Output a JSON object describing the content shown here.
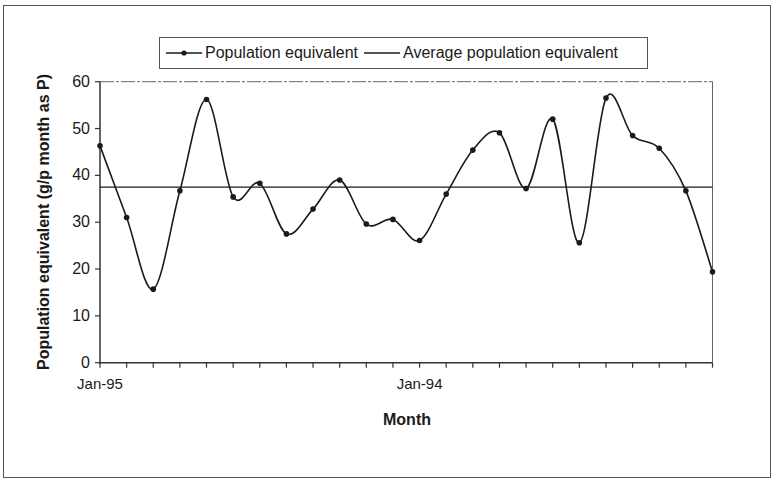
{
  "chart_data": {
    "type": "line",
    "title": "",
    "xlabel": "Month",
    "ylabel": "Population equivalent (g/p month as P)",
    "ylim": [
      0,
      60
    ],
    "yticks": [
      0,
      10,
      20,
      30,
      40,
      50,
      60
    ],
    "x_tick_labels": [
      {
        "index": 0,
        "label": "Jan-95"
      },
      {
        "index": 12,
        "label": "Jan-94"
      }
    ],
    "n_points": 24,
    "grid": false,
    "smoothed": true,
    "legend_position": "top",
    "series": [
      {
        "name": "Population equivalent",
        "marker": "circle",
        "values": [
          46.3,
          31.0,
          15.7,
          36.7,
          56.2,
          35.4,
          38.3,
          27.5,
          32.8,
          39.0,
          29.6,
          30.6,
          26.1,
          36.0,
          45.4,
          49.1,
          37.2,
          52.0,
          25.6,
          56.5,
          48.5,
          45.8,
          36.7,
          19.4
        ]
      },
      {
        "name": "Average population equivalent",
        "marker": "none",
        "values_constant": 37.5
      }
    ]
  },
  "legend": {
    "items": [
      {
        "label": "Population equivalent"
      },
      {
        "label": "Average population equivalent"
      }
    ]
  },
  "axes": {
    "x_title": "Month",
    "y_title": "Population equivalent (g/p month as P)"
  },
  "colors": {
    "line": "#1a1a1a",
    "axis": "#333333",
    "frame": "#555555"
  }
}
